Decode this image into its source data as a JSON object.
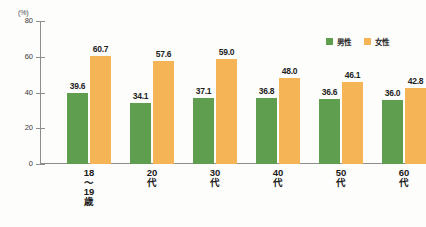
{
  "chart_data": {
    "type": "bar",
    "title": "",
    "subtitle": "",
    "xlabel": "",
    "ylabel": "",
    "unit_label": "(%)",
    "ylim": [
      0,
      80
    ],
    "ytick_values": [
      80,
      60,
      40,
      20,
      0
    ],
    "ytick_labels": [
      "80",
      "60",
      "40",
      "20",
      "0"
    ],
    "grid": false,
    "legend_position": "top-right",
    "categories": [
      "18〜19歳",
      "20代",
      "30代",
      "40代",
      "50代",
      "60代"
    ],
    "category_label_lines": [
      [
        "18",
        "〜",
        "19",
        "歳"
      ],
      [
        "20",
        "代"
      ],
      [
        "30",
        "代"
      ],
      [
        "40",
        "代"
      ],
      [
        "50",
        "代"
      ],
      [
        "60",
        "代"
      ]
    ],
    "series": [
      {
        "name": "男性",
        "color": "#5e9e4e",
        "values": [
          39.6,
          34.1,
          37.1,
          36.8,
          36.6,
          36.0
        ],
        "value_labels": [
          "39.6",
          "34.1",
          "37.1",
          "36.8",
          "36.6",
          "36.0"
        ]
      },
      {
        "name": "女性",
        "color": "#f5b456",
        "values": [
          60.7,
          57.6,
          59.0,
          48.0,
          46.1,
          42.8
        ],
        "value_labels": [
          "60.7",
          "57.6",
          "59.0",
          "48.0",
          "46.1",
          "42.8"
        ]
      }
    ]
  },
  "legend": {
    "items": [
      {
        "label": "男性",
        "color": "#5e9e4e"
      },
      {
        "label": "女性",
        "color": "#f5b456"
      }
    ]
  },
  "axis": {
    "unit": "(%)",
    "ticks": [
      "80",
      "60",
      "40",
      "20",
      "0"
    ]
  }
}
